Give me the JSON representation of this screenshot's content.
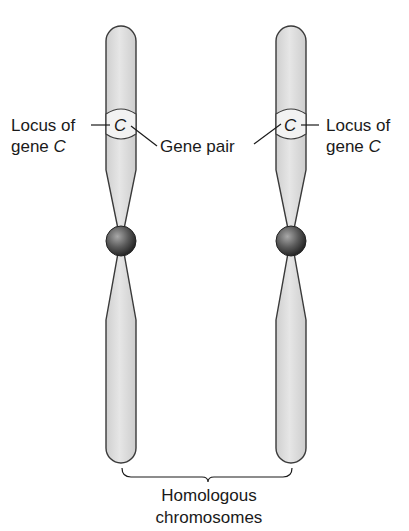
{
  "diagram": {
    "left_chromosome": {
      "locus_label_line1": "Locus of",
      "locus_label_line2_prefix": "gene ",
      "gene_letter": "C"
    },
    "right_chromosome": {
      "locus_label_line1": "Locus of",
      "locus_label_line2_prefix": "gene ",
      "gene_letter": "C"
    },
    "gene_pair_label": "Gene pair",
    "homologous_label_line1": "Homologous",
    "homologous_label_line2": "chromosomes",
    "colors": {
      "chromosome_fill": "#dcdcdc",
      "chromosome_stroke": "#3a3a3a",
      "centromere_dark": "#2e2e2e",
      "centromere_light": "#9a9a9a",
      "text": "#1a1a1a"
    }
  }
}
